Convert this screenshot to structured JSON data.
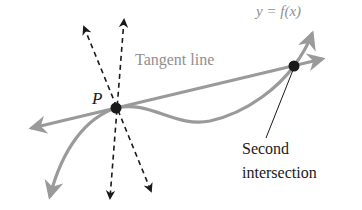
{
  "diagram": {
    "function_label": "y = f(x)",
    "tangent_label": "Tangent line",
    "point_label": "P",
    "second_label_line1": "Second",
    "second_label_line2": "intersection",
    "colors": {
      "curve": "#9a9a9a",
      "tangent": "#9a9a9a",
      "dashed": "#1a1a1a",
      "point": "#1a1a1a",
      "text_gray": "#8f8f8f",
      "text_dark": "#1a1a1a"
    }
  }
}
